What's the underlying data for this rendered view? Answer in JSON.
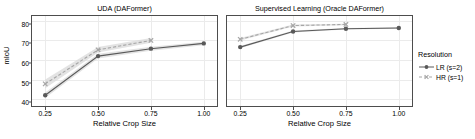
{
  "chart_data": {
    "type": "line",
    "title": "",
    "xlabel": "Relative Crop Size",
    "ylabel": "mIoU",
    "xlim": [
      0.1875,
      1.0625
    ],
    "ylim": [
      36.5,
      82.5
    ],
    "xticks": [
      0.25,
      0.5,
      0.75,
      1.0
    ],
    "xtick_labels": [
      "0.25",
      "0.50",
      "0.75",
      "1.00"
    ],
    "yticks": [
      40,
      50,
      60,
      70,
      80
    ],
    "ytick_labels": [
      "40",
      "50",
      "60",
      "70",
      "80"
    ],
    "grid": true,
    "legend": {
      "title": "Resolution",
      "position": "right",
      "entries": [
        {
          "label": "LR (s=2)",
          "color": "#595959",
          "marker": "circle",
          "linestyle": "solid"
        },
        {
          "label": "HR (s=1)",
          "color": "#a6a6a6",
          "marker": "cross",
          "linestyle": "dashed"
        }
      ]
    },
    "panels": [
      {
        "title": "UDA (DAFormer)",
        "series": [
          {
            "name": "LR (s=2)",
            "color": "#595959",
            "marker": "circle",
            "linestyle": "solid",
            "x": [
              0.25,
              0.5,
              0.75,
              1.0
            ],
            "values": [
              42.0,
              62.0,
              65.8,
              68.5
            ],
            "band_lower": [
              40.6,
              60.8,
              64.8,
              67.6
            ],
            "band_upper": [
              43.4,
              63.2,
              66.8,
              69.4
            ]
          },
          {
            "name": "HR (s=1)",
            "color": "#a6a6a6",
            "marker": "cross",
            "linestyle": "dashed",
            "x": [
              0.25,
              0.5,
              0.75
            ],
            "values": [
              47.8,
              65.2,
              70.0
            ],
            "band_lower": [
              45.6,
              63.8,
              68.8
            ],
            "band_upper": [
              50.0,
              66.6,
              71.2
            ]
          }
        ]
      },
      {
        "title": "Supervised Learning (Oracle DAFormer)",
        "series": [
          {
            "name": "LR (s=2)",
            "color": "#595959",
            "marker": "circle",
            "linestyle": "solid",
            "x": [
              0.25,
              0.5,
              0.75,
              1.0
            ],
            "values": [
              66.6,
              74.6,
              76.0,
              76.4
            ],
            "band_lower": [
              66.0,
              74.1,
              75.6,
              76.0
            ],
            "band_upper": [
              67.2,
              75.1,
              76.4,
              76.8
            ]
          },
          {
            "name": "HR (s=1)",
            "color": "#a6a6a6",
            "marker": "cross",
            "linestyle": "dashed",
            "x": [
              0.25,
              0.5,
              0.75
            ],
            "values": [
              70.6,
              77.6,
              78.2
            ],
            "band_lower": [
              70.0,
              77.1,
              77.8
            ],
            "band_upper": [
              71.2,
              78.1,
              78.6
            ]
          }
        ]
      }
    ]
  },
  "axis": {
    "ylabel": "mIoU",
    "xlabel_left": "Relative Crop Size",
    "xlabel_right": "Relative Crop Size"
  },
  "panels_meta": {
    "left_title": "UDA (DAFormer)",
    "right_title": "Supervised Learning (Oracle DAFormer)"
  },
  "legend_meta": {
    "title": "Resolution",
    "lr_label": "LR (s=2)",
    "hr_label": "HR (s=1)"
  },
  "colors": {
    "lr": "#595959",
    "hr": "#a6a6a6",
    "band": "#d9d9d9",
    "grid": "#ebebeb",
    "axis": "#4d4d4d",
    "panel_bg": "#ffffff"
  }
}
